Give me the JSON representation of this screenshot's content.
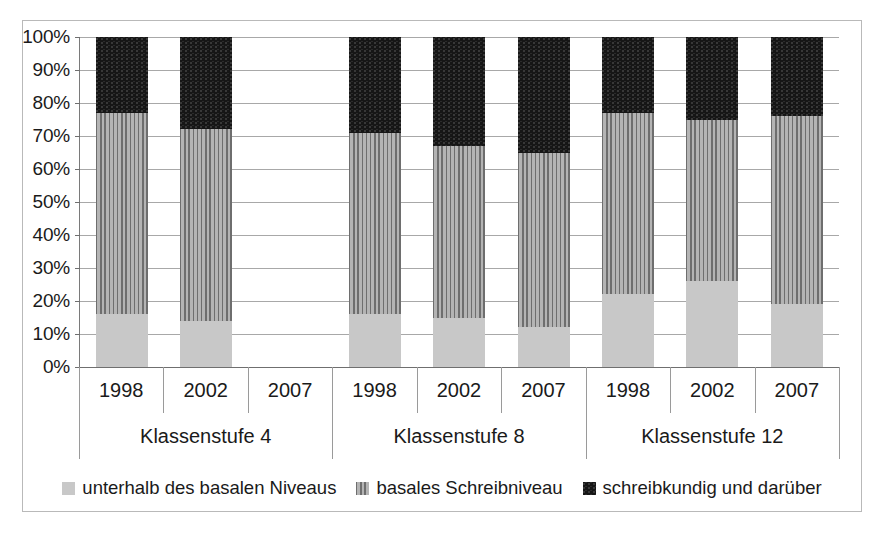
{
  "chart_data": {
    "type": "bar",
    "subtype": "100% stacked column",
    "title": "",
    "xlabel": "",
    "ylabel": "",
    "ylim": [
      0,
      100
    ],
    "y_tick_labels": [
      "0%",
      "10%",
      "20%",
      "30%",
      "40%",
      "50%",
      "60%",
      "70%",
      "80%",
      "90%",
      "100%"
    ],
    "y_tick_values": [
      0,
      10,
      20,
      30,
      40,
      50,
      60,
      70,
      80,
      90,
      100
    ],
    "grid": true,
    "legend_position": "bottom",
    "groups": [
      {
        "label": "Klassenstufe 4",
        "categories": [
          "1998",
          "2002",
          "2007"
        ]
      },
      {
        "label": "Klassenstufe 8",
        "categories": [
          "1998",
          "2002",
          "2007"
        ]
      },
      {
        "label": "Klassenstufe 12",
        "categories": [
          "1998",
          "2002",
          "2007"
        ]
      }
    ],
    "series": [
      {
        "name": "unterhalb des basalen Niveaus",
        "pattern": "light-speckle",
        "color": "#c8c8c8",
        "values": [
          16,
          14,
          null,
          16,
          15,
          12,
          22,
          26,
          19
        ]
      },
      {
        "name": "basales Schreibniveau",
        "pattern": "vertical-stripes",
        "color": "#9b9b9b",
        "values": [
          61,
          58,
          null,
          55,
          52,
          53,
          55,
          49,
          57
        ]
      },
      {
        "name": "schreibkundig und darüber",
        "pattern": "solid-black",
        "color": "#161616",
        "values": [
          23,
          28,
          null,
          29,
          33,
          35,
          23,
          25,
          24
        ]
      }
    ],
    "bars": [
      {
        "group": "Klassenstufe 4",
        "category": "1998",
        "low": 16,
        "mid": 61,
        "high": 23,
        "low_top": 16,
        "mid_top": 77,
        "has_data": true
      },
      {
        "group": "Klassenstufe 4",
        "category": "2002",
        "low": 14,
        "mid": 58,
        "high": 28,
        "low_top": 14,
        "mid_top": 72,
        "has_data": true
      },
      {
        "group": "Klassenstufe 4",
        "category": "2007",
        "low": null,
        "mid": null,
        "high": null,
        "low_top": 0,
        "mid_top": 0,
        "has_data": false
      },
      {
        "group": "Klassenstufe 8",
        "category": "1998",
        "low": 16,
        "mid": 55,
        "high": 29,
        "low_top": 16,
        "mid_top": 71,
        "has_data": true
      },
      {
        "group": "Klassenstufe 8",
        "category": "2002",
        "low": 15,
        "mid": 52,
        "high": 33,
        "low_top": 15,
        "mid_top": 67,
        "has_data": true
      },
      {
        "group": "Klassenstufe 8",
        "category": "2007",
        "low": 12,
        "mid": 53,
        "high": 35,
        "low_top": 12,
        "mid_top": 65,
        "has_data": true
      },
      {
        "group": "Klassenstufe 12",
        "category": "1998",
        "low": 22,
        "mid": 55,
        "high": 23,
        "low_top": 22,
        "mid_top": 77,
        "has_data": true
      },
      {
        "group": "Klassenstufe 12",
        "category": "2002",
        "low": 26,
        "mid": 49,
        "high": 25,
        "low_top": 26,
        "mid_top": 75,
        "has_data": true
      },
      {
        "group": "Klassenstufe 12",
        "category": "2007",
        "low": 19,
        "mid": 57,
        "high": 24,
        "low_top": 19,
        "mid_top": 76,
        "has_data": true
      }
    ],
    "legend": [
      {
        "label": "unterhalb des basalen Niveaus",
        "swatch": "light-speckle-swatch"
      },
      {
        "label": "basales Schreibniveau",
        "swatch": "vertical-stripes-swatch"
      },
      {
        "label": "schreibkundig und darüber",
        "swatch": "solid-black-swatch"
      }
    ]
  }
}
